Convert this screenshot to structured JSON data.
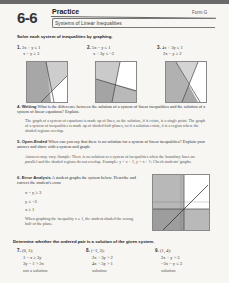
{
  "header": {
    "lesson_number": "6-6",
    "title": "Practice",
    "form": "Form G",
    "subtitle": "Systems of Linear Inequalities"
  },
  "section1": {
    "instruction": "Solve each system of inequalities by graphing.",
    "problems": [
      {
        "num": "1.",
        "eq1": "3x + y ≤ 1",
        "eq2": "x − y ≥ 3"
      },
      {
        "num": "2.",
        "eq1": "5x − y ≤ 1",
        "eq2": "x + 3y ≤ −2"
      },
      {
        "num": "3.",
        "eq1": "4x + 3y ≤ 1",
        "eq2": "2x − y ≥ 2"
      }
    ]
  },
  "q4": {
    "num": "4.",
    "label": "Writing",
    "question": "What is the difference between the solution of a system of linear inequalities and the solution of a system of linear equations? Explain.",
    "answer": "The graph of a system of equations is made up of lines, so the solution, if it exists, is a single point. The graph of a system of inequalities is made up of shaded half-planes, so if a solution exists, it is a region where the shaded regions overlap."
  },
  "q5": {
    "num": "5.",
    "label": "Open-Ended",
    "question": "When can you say that there is no solution for a system of linear inequalities? Explain your answer and show with a system and graph.",
    "answer": "Answers may vary. Sample: There is no solution to a system of inequalities when the boundary lines are parallel and the shaded regions do not overlap. Example: y < x − 1, y > x + 1; Check students' graphs."
  },
  "q6": {
    "num": "6.",
    "label": "Error Analysis",
    "question": "A student graphs the system below. Describe and correct the student's error.",
    "system": [
      "x − y ≥ 3",
      "y ≤ −3",
      "x ≥ 1"
    ],
    "answer": "When graphing the inequality x ≥ 1, the student shaded the wrong half of the plane."
  },
  "section2": {
    "instruction": "Determine whether the ordered pair is a solution of the given system.",
    "problems": [
      {
        "num": "7.",
        "point": "(0, 1);",
        "eq1": "1 − x ≥ 3y",
        "eq2": "3y − 1 > 2x",
        "answer": "not a solution"
      },
      {
        "num": "8.",
        "point": "(−1, 3);",
        "eq1": "2x + 3y > 2",
        "eq2": "4x + 5y > 1",
        "answer": "solution"
      },
      {
        "num": "9.",
        "point": "(1, 4);",
        "eq1": "2x + y > 3",
        "eq2": "−3x − y ≤ 3",
        "answer": "solution"
      }
    ]
  },
  "colors": {
    "shade_dark": "#8a8a8a",
    "shade_light": "#b8b8b8",
    "overlap": "#6f6f6f"
  }
}
